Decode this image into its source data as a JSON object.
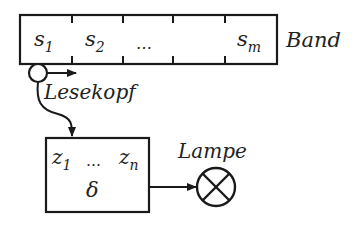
{
  "diagram": {
    "tape": {
      "label": "Band",
      "cells": [
        {
          "symbol": "s",
          "index": "1"
        },
        {
          "symbol": "s",
          "index": "2"
        },
        {
          "symbol": "…",
          "index": ""
        },
        {
          "symbol": "",
          "index": ""
        },
        {
          "symbol": "s",
          "index": "m"
        }
      ]
    },
    "head": {
      "label": "Lesekopf"
    },
    "control": {
      "states": {
        "first_symbol": "z",
        "first_index": "1",
        "ellipsis": "…",
        "last_symbol": "z",
        "last_index": "n"
      },
      "function": "δ"
    },
    "lamp": {
      "label": "Lampe"
    },
    "colors": {
      "stroke": "#1a1a1a",
      "text": "#222222",
      "background": "#ffffff"
    }
  }
}
